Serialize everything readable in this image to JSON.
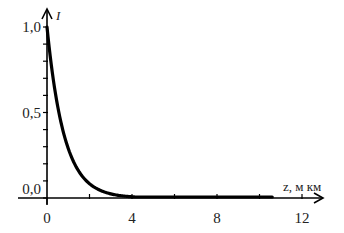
{
  "chart_data": {
    "type": "line",
    "title": "",
    "xlabel": "z, мкм",
    "ylabel": "I",
    "xlim": [
      -1.3,
      12.5
    ],
    "ylim": [
      0,
      1.0
    ],
    "x_ticks": [
      0,
      2,
      4,
      6,
      8,
      10,
      12
    ],
    "x_tick_labels": [
      "0",
      "4",
      "8",
      "12"
    ],
    "x_labeled_ticks": [
      0,
      4,
      8,
      12
    ],
    "y_ticks": [
      0,
      0.1,
      0.2,
      0.3,
      0.4,
      0.5,
      0.6,
      0.7,
      0.8,
      0.9,
      1.0
    ],
    "y_tick_labels": [
      "0,0",
      "0,5",
      "1,0"
    ],
    "y_labeled_ticks": [
      0,
      0.5,
      1.0
    ],
    "grid": false,
    "legend": null,
    "series": [
      {
        "name": "I(z)",
        "x": [
          0,
          0.25,
          0.5,
          0.75,
          1.0,
          1.5,
          2.0,
          2.5,
          3.0,
          4.0,
          5.0,
          6.0,
          8.0,
          10.6
        ],
        "values": [
          1.0,
          0.73,
          0.54,
          0.39,
          0.29,
          0.16,
          0.084,
          0.045,
          0.024,
          0.007,
          0.002,
          0.0006,
          0.0,
          0.0
        ]
      }
    ]
  }
}
